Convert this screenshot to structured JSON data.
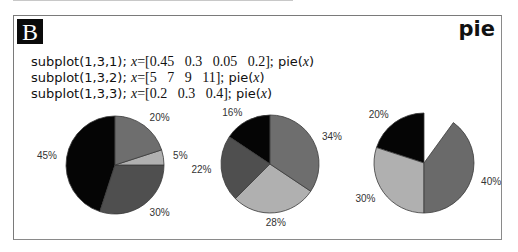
{
  "badge": "B",
  "title": "pie",
  "code_lines": [
    {
      "cmd": "subplot(1,3,1);",
      "var": "x",
      "eq": "=",
      "vector": "[0.45   0.3   0.05   0.2];",
      "call": "pie(",
      "arg": "x",
      "close": ")"
    },
    {
      "cmd": "subplot(1,3,2);",
      "var": "x",
      "eq": "=",
      "vector": "[5   7   9   11];",
      "call": "pie(",
      "arg": "x",
      "close": ")"
    },
    {
      "cmd": "subplot(1,3,3);",
      "var": "x",
      "eq": "=",
      "vector": "[0.2   0.3   0.4];",
      "call": "pie(",
      "arg": "x",
      "close": ")"
    }
  ],
  "colors": {
    "slice_outline": "#3a3a3a",
    "palette4": [
      "#050505",
      "#4f4f4f",
      "#b0b0b0",
      "#6e6e6e"
    ],
    "palette3": [
      "#050505",
      "#b0b0b0",
      "#6a6a6a"
    ]
  },
  "chart_data": [
    {
      "type": "pie",
      "subplot": "1,3,1",
      "values": [
        0.45,
        0.3,
        0.05,
        0.2
      ],
      "labels": [
        "45%",
        "30%",
        "5%",
        "20%"
      ],
      "partial": false,
      "direction": "counterclockwise from top"
    },
    {
      "type": "pie",
      "subplot": "1,3,2",
      "values": [
        5,
        7,
        9,
        11
      ],
      "labels": [
        "16%",
        "22%",
        "28%",
        "34%"
      ],
      "partial": false,
      "direction": "counterclockwise from top"
    },
    {
      "type": "pie",
      "subplot": "1,3,3",
      "values": [
        0.2,
        0.3,
        0.4
      ],
      "labels": [
        "20%",
        "30%",
        "40%"
      ],
      "partial": true,
      "direction": "counterclockwise from top"
    }
  ]
}
